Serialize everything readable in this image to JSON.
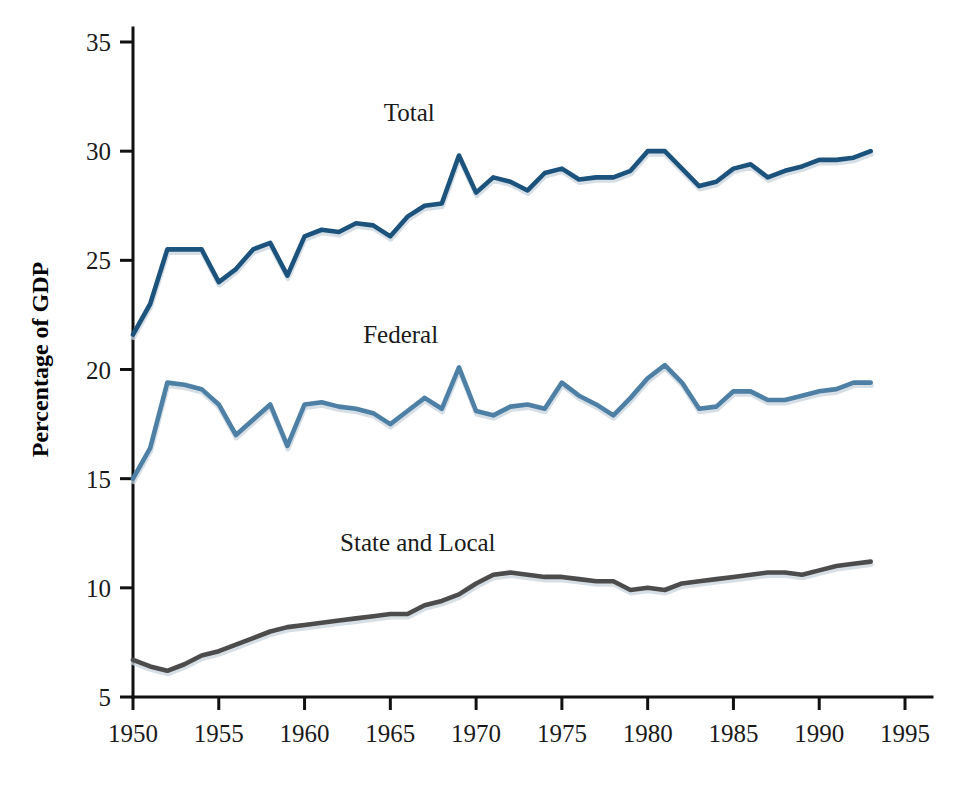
{
  "chart_data": {
    "type": "line",
    "title": "",
    "xlabel": "",
    "ylabel": "Percentage of GDP",
    "xlim": [
      1949,
      1996
    ],
    "ylim": [
      5,
      35
    ],
    "grid": false,
    "legend_position": "inline-labels",
    "x_ticks": [
      "1950",
      "1955",
      "1960",
      "1965",
      "1970",
      "1975",
      "1980",
      "1985",
      "1990",
      "1995"
    ],
    "x_tick_values": [
      1950,
      1955,
      1960,
      1965,
      1970,
      1975,
      1980,
      1985,
      1990,
      1995
    ],
    "y_ticks": [
      "5",
      "10",
      "15",
      "20",
      "25",
      "30",
      "35"
    ],
    "y_tick_values": [
      5,
      10,
      15,
      20,
      25,
      30,
      35
    ],
    "x": [
      1950,
      1951,
      1952,
      1953,
      1954,
      1955,
      1956,
      1957,
      1958,
      1959,
      1960,
      1961,
      1962,
      1963,
      1964,
      1965,
      1966,
      1967,
      1968,
      1969,
      1970,
      1971,
      1972,
      1973,
      1974,
      1975,
      1976,
      1977,
      1978,
      1979,
      1980,
      1981,
      1982,
      1983,
      1984,
      1985,
      1986,
      1987,
      1988,
      1989,
      1990,
      1991,
      1992,
      1993
    ],
    "series": [
      {
        "name": "Total",
        "color": "#1c537d",
        "label_x": 1966.1,
        "label_y": 31.4,
        "values": [
          21.6,
          23.0,
          25.5,
          25.5,
          25.5,
          24.0,
          24.6,
          25.5,
          25.8,
          24.3,
          26.1,
          26.4,
          26.3,
          26.7,
          26.6,
          26.1,
          27.0,
          27.5,
          27.6,
          29.8,
          28.1,
          28.8,
          28.6,
          28.2,
          29.0,
          29.2,
          28.7,
          28.8,
          28.8,
          29.1,
          30.0,
          30.0,
          29.2,
          28.4,
          28.6,
          29.2,
          29.4,
          28.8,
          29.1,
          29.3,
          29.6,
          29.6,
          29.7,
          30.0
        ]
      },
      {
        "name": "Federal",
        "color": "#4e80a6",
        "label_x": 1965.6,
        "label_y": 21.2,
        "values": [
          15.0,
          16.4,
          19.4,
          19.3,
          19.1,
          18.4,
          17.0,
          17.7,
          18.4,
          16.5,
          18.4,
          18.5,
          18.3,
          18.2,
          18.0,
          17.5,
          18.1,
          18.7,
          18.2,
          20.1,
          18.1,
          17.9,
          18.3,
          18.4,
          18.2,
          19.4,
          18.8,
          18.4,
          17.9,
          18.7,
          19.6,
          20.2,
          19.4,
          18.2,
          18.3,
          19.0,
          19.0,
          18.6,
          18.6,
          18.8,
          19.0,
          19.1,
          19.4,
          19.4
        ]
      },
      {
        "name": "State and Local",
        "color": "#4c4c4c",
        "label_x": 1966.6,
        "label_y": 11.7,
        "values": [
          6.7,
          6.4,
          6.2,
          6.5,
          6.9,
          7.1,
          7.4,
          7.7,
          8.0,
          8.2,
          8.3,
          8.4,
          8.5,
          8.6,
          8.7,
          8.8,
          8.8,
          9.2,
          9.4,
          9.7,
          10.2,
          10.6,
          10.7,
          10.6,
          10.5,
          10.5,
          10.4,
          10.3,
          10.3,
          9.9,
          10.0,
          9.9,
          10.2,
          10.3,
          10.4,
          10.5,
          10.6,
          10.7,
          10.7,
          10.6,
          10.8,
          11.0,
          11.1,
          11.2
        ]
      }
    ]
  },
  "axis": {
    "y_title": "Percentage of GDP"
  }
}
